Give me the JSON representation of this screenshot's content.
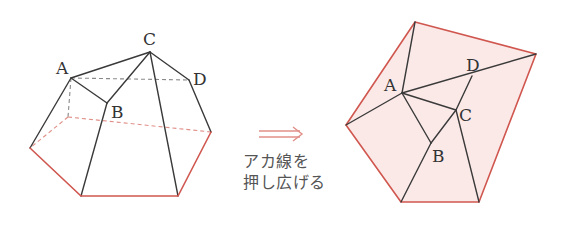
{
  "colors": {
    "edge": "#3a3a3a",
    "hidden_edge": "#8a8a8a",
    "red_edge": "#d0574f",
    "net_fill": "#fbe9e8",
    "arrow": "#e08f88",
    "caption_text": "#555555"
  },
  "left_figure": {
    "description": "3D solid (frustum-like polyhedron) with top vertices A, B, C, D",
    "labels": {
      "A": "A",
      "B": "B",
      "C": "C",
      "D": "D"
    }
  },
  "arrow": {
    "symbol": "double-arrow-right"
  },
  "caption": {
    "line1": "アカ線を",
    "line2": "押し広げる"
  },
  "right_figure": {
    "description": "Flattened net of the top faces, shaded pink with red outline",
    "labels": {
      "A": "A",
      "B": "B",
      "C": "C",
      "D": "D"
    }
  }
}
